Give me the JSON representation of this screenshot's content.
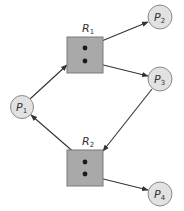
{
  "diagram": {
    "type": "resource-allocation-graph",
    "colors": {
      "process_fill": "#e2e2e2",
      "process_stroke": "#8a8a8a",
      "resource_fill": "#a9a9a9",
      "resource_stroke": "#7a7a7a",
      "edge": "#333333",
      "instance_dot": "#1a1a1a"
    },
    "processes": [
      {
        "id": "P1",
        "base": "P",
        "sub": "1",
        "cx": 22,
        "cy": 107
      },
      {
        "id": "P2",
        "base": "P",
        "sub": "2",
        "cx": 160,
        "cy": 17
      },
      {
        "id": "P3",
        "base": "P",
        "sub": "3",
        "cx": 160,
        "cy": 79
      },
      {
        "id": "P4",
        "base": "P",
        "sub": "4",
        "cx": 160,
        "cy": 194
      }
    ],
    "resources": [
      {
        "id": "R1",
        "base": "R",
        "sub": "1",
        "x": 67,
        "y": 37,
        "size": 36,
        "instances": 2
      },
      {
        "id": "R2",
        "base": "R",
        "sub": "2",
        "x": 67,
        "y": 150,
        "size": 36,
        "instances": 2
      }
    ],
    "edges": [
      {
        "from": "P1",
        "to": "R1",
        "kind": "request"
      },
      {
        "from": "R1",
        "to": "P2",
        "kind": "assignment"
      },
      {
        "from": "R1",
        "to": "P3",
        "kind": "assignment"
      },
      {
        "from": "P3",
        "to": "R2",
        "kind": "request"
      },
      {
        "from": "R2",
        "to": "P1",
        "kind": "assignment"
      },
      {
        "from": "R2",
        "to": "P4",
        "kind": "assignment"
      }
    ]
  }
}
